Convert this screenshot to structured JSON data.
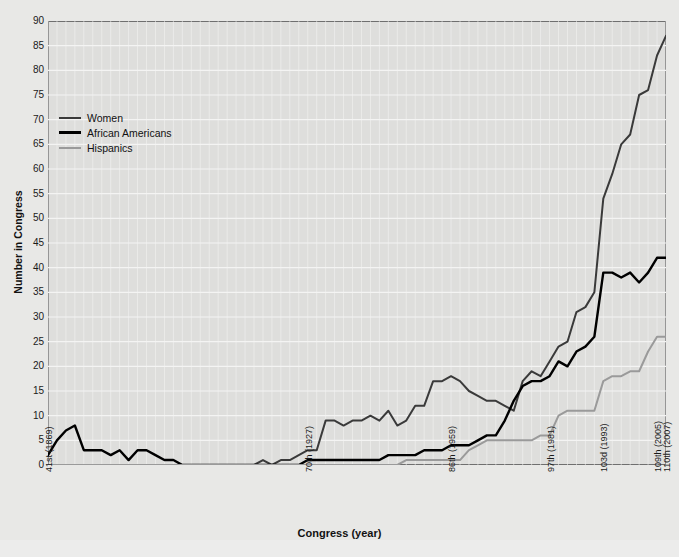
{
  "chart_data": {
    "type": "line",
    "title": "",
    "xlabel": "Congress (year)",
    "ylabel": "Number in Congress",
    "ylim": [
      0,
      90
    ],
    "ytick_step": 5,
    "yticks": [
      0,
      5,
      10,
      15,
      20,
      25,
      30,
      35,
      40,
      45,
      50,
      55,
      60,
      65,
      70,
      75,
      80,
      85,
      90
    ],
    "grid": true,
    "legend_position": "upper-left-inside",
    "xlim_congress": [
      41,
      110
    ],
    "x_tick_congress": [
      41,
      70,
      86,
      97,
      103,
      109,
      110
    ],
    "xtick_labels": [
      "41st (1869)",
      "70th (1927)",
      "86th (1959)",
      "97th (1981)",
      "103d (1993)",
      "109th (2005)",
      "110th (2007)"
    ],
    "x": [
      41,
      42,
      43,
      44,
      45,
      46,
      47,
      48,
      49,
      50,
      51,
      52,
      53,
      54,
      55,
      56,
      57,
      58,
      59,
      60,
      61,
      62,
      63,
      64,
      65,
      66,
      67,
      68,
      69,
      70,
      71,
      72,
      73,
      74,
      75,
      76,
      77,
      78,
      79,
      80,
      81,
      82,
      83,
      84,
      85,
      86,
      87,
      88,
      89,
      90,
      91,
      92,
      93,
      94,
      95,
      96,
      97,
      98,
      99,
      100,
      101,
      102,
      103,
      104,
      105,
      106,
      107,
      108,
      109,
      110
    ],
    "series": [
      {
        "name": "Women",
        "color": "#3a3a3a",
        "values": [
          0,
          0,
          0,
          0,
          0,
          0,
          0,
          0,
          0,
          0,
          0,
          0,
          0,
          0,
          0,
          0,
          0,
          0,
          0,
          0,
          0,
          0,
          0,
          0,
          1,
          0,
          1,
          1,
          2,
          3,
          3,
          9,
          9,
          8,
          9,
          9,
          10,
          9,
          11,
          8,
          9,
          12,
          12,
          17,
          17,
          18,
          17,
          15,
          14,
          13,
          13,
          12,
          11,
          17,
          19,
          18,
          21,
          24,
          25,
          31,
          32,
          35,
          54,
          59,
          65,
          67,
          75,
          76,
          83,
          87
        ],
        "peak_mid_century": 20,
        "endpoint": 87
      },
      {
        "name": "African Americans",
        "color": "#000000",
        "values": [
          2,
          5,
          7,
          8,
          3,
          3,
          3,
          2,
          3,
          1,
          3,
          3,
          2,
          1,
          1,
          0,
          0,
          0,
          0,
          0,
          0,
          0,
          0,
          0,
          0,
          0,
          0,
          0,
          0,
          1,
          1,
          1,
          1,
          1,
          1,
          1,
          1,
          1,
          2,
          2,
          2,
          2,
          3,
          3,
          3,
          4,
          4,
          4,
          5,
          6,
          6,
          9,
          13,
          16,
          17,
          17,
          18,
          21,
          20,
          23,
          24,
          26,
          39,
          39,
          38,
          39,
          37,
          39,
          42,
          42
        ],
        "endpoint": 42
      },
      {
        "name": "Hispanics",
        "color": "#9a9a9a",
        "values": [
          0,
          0,
          0,
          0,
          0,
          0,
          0,
          0,
          0,
          0,
          0,
          0,
          0,
          0,
          0,
          0,
          0,
          0,
          0,
          0,
          0,
          0,
          0,
          0,
          0,
          0,
          0,
          0,
          0,
          0,
          0,
          0,
          0,
          0,
          0,
          0,
          0,
          0,
          0,
          0,
          1,
          1,
          1,
          1,
          1,
          1,
          1,
          3,
          4,
          5,
          5,
          5,
          5,
          5,
          5,
          6,
          6,
          10,
          11,
          11,
          11,
          11,
          17,
          18,
          18,
          19,
          19,
          23,
          26,
          26
        ],
        "endpoint": 26
      }
    ]
  },
  "legend": {
    "items": [
      {
        "label": "Women",
        "color": "#3a3a3a",
        "thickness": 2
      },
      {
        "label": "African Americans",
        "color": "#000000",
        "thickness": 3
      },
      {
        "label": "Hispanics",
        "color": "#9a9a9a",
        "thickness": 2
      }
    ]
  },
  "axes": {
    "y_title": "Number in Congress",
    "x_title": "Congress (year)"
  },
  "colors": {
    "page_background": "#e8e8e6",
    "plot_background": "#dededc",
    "gridline": "#f4f4f3",
    "axis_border": "#6f6f6f",
    "text": "#1a1a1a"
  }
}
